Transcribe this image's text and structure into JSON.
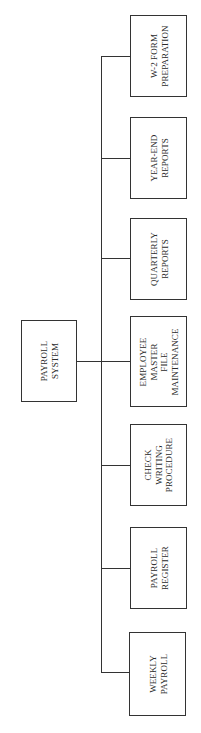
{
  "diagram": {
    "type": "hierarchy-chart",
    "orientation": "rotated-90-ccw",
    "root": {
      "id": "payroll-system",
      "lines": [
        "PAYROLL",
        "SYSTEM"
      ]
    },
    "children": [
      {
        "id": "w2-form-preparation",
        "lines": [
          "W-2 FORM",
          "PREPARATION"
        ]
      },
      {
        "id": "year-end-reports",
        "lines": [
          "YEAR-END",
          "REPORTS"
        ]
      },
      {
        "id": "quarterly-reports",
        "lines": [
          "QUARTERLY",
          "REPORTS"
        ]
      },
      {
        "id": "employee-master-file-maintenance",
        "lines": [
          "EMPLOYEE",
          "MASTER",
          "FILE",
          "MAINTENANCE"
        ]
      },
      {
        "id": "check-writing-procedure",
        "lines": [
          "CHECK",
          "WRITING",
          "PROCEDURE"
        ]
      },
      {
        "id": "payroll-register",
        "lines": [
          "PAYROLL",
          "REGISTER"
        ]
      },
      {
        "id": "weekly-payroll",
        "lines": [
          "WEEKLY",
          "PAYROLL"
        ]
      }
    ],
    "colors": {
      "line": "#333333",
      "text": "#2a2a2a",
      "background": "#ffffff"
    }
  }
}
